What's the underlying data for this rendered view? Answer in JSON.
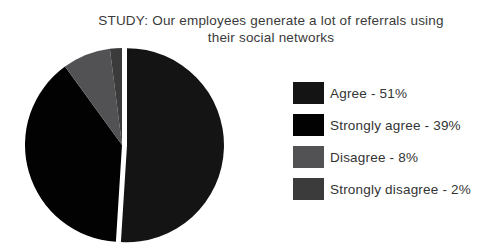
{
  "title": {
    "line1": "STUDY: Our employees generate a lot of referrals using",
    "line2": "their social networks"
  },
  "legend": {
    "items": [
      {
        "label": "Agree - 51%"
      },
      {
        "label": "Strongly agree - 39%"
      },
      {
        "label": "Disagree - 8%"
      },
      {
        "label": "Strongly disagree - 2%"
      }
    ]
  },
  "colors": {
    "background": "#ffffff",
    "title_text": "#3a3a3a",
    "legend_text": "#333333"
  },
  "chart_data": {
    "type": "pie",
    "title": "STUDY: Our employees generate a lot of referrals using their social networks",
    "slices": [
      {
        "label": "Agree",
        "value": 51,
        "color": "#141414",
        "exploded": true
      },
      {
        "label": "Strongly agree",
        "value": 39,
        "color": "#020202",
        "exploded": false
      },
      {
        "label": "Disagree",
        "value": 8,
        "color": "#525254",
        "exploded": false
      },
      {
        "label": "Strongly disagree",
        "value": 2,
        "color": "#3b3b3c",
        "exploded": false
      }
    ],
    "start_angle_deg": 0,
    "direction": "clockwise",
    "legend_position": "right",
    "explode_offset_px": 5
  }
}
